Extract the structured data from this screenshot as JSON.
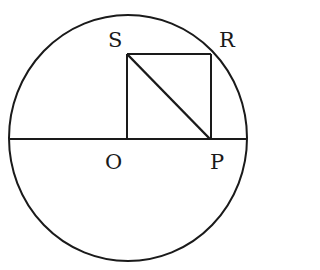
{
  "diagram": {
    "labels": {
      "S": "S",
      "R": "R",
      "O": "O",
      "P": "P"
    },
    "points": {
      "O": [
        127,
        139
      ],
      "P": [
        210,
        139
      ],
      "R": [
        211,
        54
      ],
      "S": [
        127,
        54
      ]
    },
    "circle": {
      "cx": 128,
      "cy": 138,
      "rx": 119,
      "ry": 123
    },
    "segments": [
      [
        "diameter-left",
        "diameter-right"
      ],
      [
        "S",
        "O"
      ],
      [
        "S",
        "R"
      ],
      [
        "R",
        "P"
      ],
      [
        "S",
        "P"
      ]
    ],
    "stroke_color": "#1a1a1a"
  }
}
